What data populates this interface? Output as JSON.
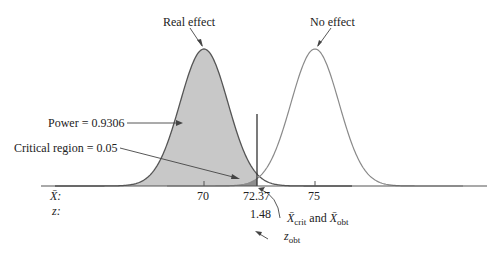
{
  "labels": {
    "real_effect": "Real effect",
    "no_effect": "No effect",
    "power": "Power = 0.9306",
    "critical_region": "Critical region = 0.05",
    "xbar_axis": "X̄:",
    "z_axis": "z:",
    "tick_70": "70",
    "tick_7237": "72.37",
    "tick_75": "75",
    "z_value": "1.48",
    "crit_label_x1": "X̄",
    "crit_sub1": "crit",
    "crit_and": " and ",
    "crit_label_x2": "X̄",
    "crit_sub2": "obt",
    "zobt_z": "z",
    "zobt_sub": "obt"
  },
  "colors": {
    "power_fill": "#c8c8c8",
    "critical_fill": "#8e8e8e",
    "curve": "#555555",
    "no_effect_curve": "#8a8a8a"
  },
  "chart_data": {
    "type": "area",
    "title": "",
    "series": [
      {
        "name": "Real effect",
        "mean": 70
      },
      {
        "name": "No effect",
        "mean": 75
      }
    ],
    "critical_value_xbar": 72.37,
    "z_obt": 1.48,
    "power": 0.9306,
    "alpha": 0.05,
    "xticks": [
      70,
      72.37,
      75
    ]
  }
}
